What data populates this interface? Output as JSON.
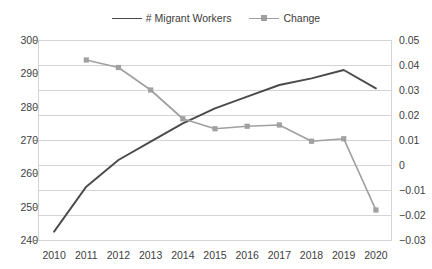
{
  "chart_data": {
    "type": "line",
    "title": "",
    "xlabel": "",
    "ylabel": "",
    "y2label": "",
    "grid": true,
    "legend_position": "top-center",
    "categories": [
      "2010",
      "2011",
      "2012",
      "2013",
      "2014",
      "2015",
      "2016",
      "2017",
      "2018",
      "2019",
      "2020"
    ],
    "ylim": [
      240,
      300
    ],
    "yticks": [
      "240",
      "250",
      "260",
      "270",
      "280",
      "290",
      "300"
    ],
    "y2lim": [
      -0.03,
      0.05
    ],
    "y2ticks": [
      "-0.03",
      "-0.02",
      "-0.01",
      "0",
      "0.01",
      "0.02",
      "0.03",
      "0.04",
      "0.05"
    ],
    "series": [
      {
        "name": "# Migrant Workers",
        "axis": "left",
        "color": "#4a4a4a",
        "marker": "none",
        "values": [
          242.5,
          256.0,
          264.0,
          269.5,
          275.0,
          279.5,
          283.0,
          286.5,
          288.5,
          291.0,
          285.5
        ]
      },
      {
        "name": "Change",
        "axis": "right",
        "color": "#a0a0a0",
        "marker": "square",
        "values": [
          null,
          0.042,
          0.039,
          0.03,
          0.0185,
          0.0145,
          0.0155,
          0.016,
          0.0095,
          0.0105,
          -0.018
        ]
      }
    ]
  },
  "legend": {
    "entries": [
      {
        "label": "# Migrant Workers",
        "color": "#4a4a4a",
        "marker": "none"
      },
      {
        "label": "Change",
        "color": "#a0a0a0",
        "marker": "square"
      }
    ]
  },
  "colors": {
    "migrant_workers": "#4a4a4a",
    "change": "#a0a0a0",
    "gridline": "#d4d4d4",
    "text": "#404040",
    "background": "#ffffff"
  }
}
